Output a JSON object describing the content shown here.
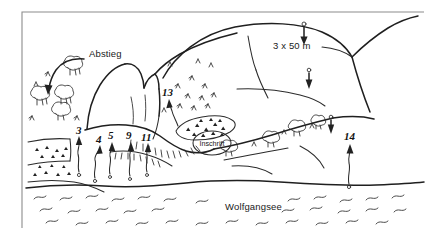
{
  "figure": {
    "kind": "hand-drawn-climbing-topo",
    "width": 435,
    "height": 239,
    "background_color": "#ffffff",
    "ink_color": "#2b2b2b",
    "frame_color": "#8c8c8c"
  },
  "labels": {
    "descent": "Abstieg",
    "rappel": "3 x 50 m",
    "inscription": "Inschrift",
    "lake": "Wolfgangsee"
  },
  "routes": [
    {
      "number": "3",
      "x": 81,
      "y": 134
    },
    {
      "number": "4",
      "x": 101,
      "y": 143
    },
    {
      "number": "5",
      "x": 113,
      "y": 139
    },
    {
      "number": "9",
      "x": 131,
      "y": 139
    },
    {
      "number": "11",
      "x": 146,
      "y": 141
    },
    {
      "number": "13",
      "x": 168,
      "y": 96
    },
    {
      "number": "14",
      "x": 350,
      "y": 140
    }
  ],
  "features": {
    "descent_label": "Abstieg",
    "descent_direction": "down-left",
    "rappel_pitches": 3,
    "rappel_pitch_length_m": 50,
    "rappel_anchors": 3,
    "lake_name": "Wolfgangsee",
    "inscription_marker": "Inschrift",
    "terrain": [
      "summit-ridge",
      "rock-face",
      "scree-field",
      "bushes",
      "grass-tufts",
      "shoreline",
      "water"
    ]
  },
  "text_positions": {
    "abstieg": {
      "x": 89,
      "y": 57
    },
    "rappel": {
      "x": 273,
      "y": 46
    },
    "inschrift": {
      "x": 212,
      "y": 143
    },
    "wolfgangsee": {
      "x": 225,
      "y": 207
    }
  }
}
